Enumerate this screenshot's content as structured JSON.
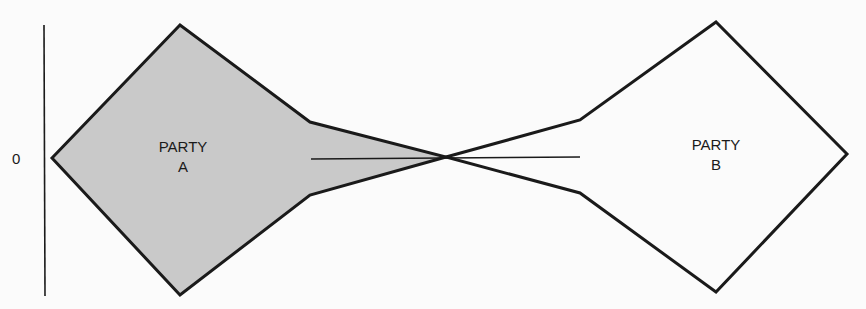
{
  "diagram": {
    "axis": {
      "label": "0"
    },
    "party_a": {
      "line1": "PARTY",
      "line2": "A",
      "fill": "#c9c9c9",
      "stroke": "#1a1a1a"
    },
    "party_b": {
      "line1": "PARTY",
      "line2": "B",
      "fill": "#fbfbfb",
      "stroke": "#1a1a1a"
    },
    "colors": {
      "background": "#fbfbfb",
      "ink": "#1a1a1a",
      "shade": "#c9c9c9"
    }
  }
}
